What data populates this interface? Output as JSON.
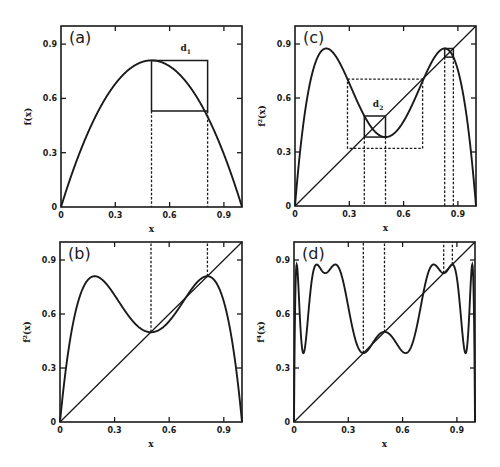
{
  "chart_data": [
    {
      "panel": "a",
      "type": "line",
      "panel_label": "(a)",
      "xlabel": "x",
      "ylabel": "f(x)",
      "xlim": [
        0,
        1
      ],
      "ylim": [
        0,
        1
      ],
      "x_ticks": [
        "0",
        "0.3",
        "0.6",
        "0.9"
      ],
      "y_ticks": [
        "0",
        "0.3",
        "0.6",
        "0.9"
      ],
      "series": [
        {
          "name": "f(x) = r x (1 - x)",
          "r": 3.24,
          "iterate": 1,
          "peak": 0.81
        }
      ],
      "annotations": [
        {
          "text": "d",
          "subscript": "1",
          "x": 0.66,
          "y": 0.86
        }
      ],
      "cobweb_solid": [
        [
          0.5,
          0.53
        ],
        [
          0.5,
          0.81
        ],
        [
          0.81,
          0.81
        ],
        [
          0.81,
          0.53
        ],
        [
          0.5,
          0.53
        ]
      ],
      "dashed_verticals": [
        {
          "x": 0.5,
          "y_top": 0.53
        },
        {
          "x": 0.81,
          "y_top": 0.53
        }
      ],
      "grid": false
    },
    {
      "panel": "b",
      "type": "line",
      "panel_label": "(b)",
      "xlabel": "x",
      "ylabel": "f²(x)",
      "xlim": [
        0,
        1
      ],
      "ylim": [
        0,
        1
      ],
      "x_ticks": [
        "0",
        "0.3",
        "0.6",
        "0.9"
      ],
      "y_ticks": [
        "0",
        "0.3",
        "0.6",
        "0.9"
      ],
      "series": [
        {
          "name": "f²(x)",
          "r": 3.24,
          "iterate": 2
        },
        {
          "name": "y = x",
          "diagonal": true
        }
      ],
      "dashed_verticals": [
        {
          "x": 0.5,
          "from_y": 0.5,
          "to_top": true
        },
        {
          "x": 0.81,
          "from_y": 0.81,
          "to_top": true
        }
      ],
      "grid": false
    },
    {
      "panel": "c",
      "type": "line",
      "panel_label": "(c)",
      "xlabel": "x",
      "ylabel": "f²(x)",
      "xlim": [
        0,
        1
      ],
      "ylim": [
        0,
        1
      ],
      "x_ticks": [
        "0",
        "0.3",
        "0.6",
        "0.9"
      ],
      "y_ticks": [
        "0",
        "0.3",
        "0.6",
        "0.9"
      ],
      "series": [
        {
          "name": "f²(x)",
          "r": 3.5,
          "iterate": 2
        },
        {
          "name": "y = x",
          "diagonal": true
        }
      ],
      "annotations": [
        {
          "text": "d",
          "subscript": "2",
          "x": 0.43,
          "y": 0.55
        }
      ],
      "solid_boxes": [
        {
          "x0": 0.383,
          "x1": 0.5,
          "y0": 0.383,
          "y1": 0.5,
          "with_cross": true
        },
        {
          "x0": 0.827,
          "x1": 0.875,
          "y0": 0.827,
          "y1": 0.875,
          "with_cross": true
        }
      ],
      "dashed_box": {
        "x0": 0.29,
        "x1": 0.705,
        "y0": 0.32,
        "y1": 0.705
      },
      "dashed_verticals": [
        {
          "x": 0.383
        },
        {
          "x": 0.5
        },
        {
          "x": 0.827
        },
        {
          "x": 0.875
        }
      ],
      "grid": false
    },
    {
      "panel": "d",
      "type": "line",
      "panel_label": "(d)",
      "xlabel": "x",
      "ylabel": "f⁴(x)",
      "xlim": [
        0,
        1
      ],
      "ylim": [
        0,
        1
      ],
      "x_ticks": [
        "0",
        "0.3",
        "0.6",
        "0.9"
      ],
      "y_ticks": [
        "0",
        "0.3",
        "0.6",
        "0.9"
      ],
      "series": [
        {
          "name": "f⁴(x)",
          "r": 3.5,
          "iterate": 4
        },
        {
          "name": "y = x",
          "diagonal": true
        }
      ],
      "dashed_verticals": [
        {
          "x": 0.383,
          "from_y": 0.383,
          "to_top": true
        },
        {
          "x": 0.5,
          "from_y": 0.5,
          "to_top": true
        },
        {
          "x": 0.827,
          "from_y": 0.827,
          "to_top": true
        },
        {
          "x": 0.875,
          "from_y": 0.875,
          "to_top": true
        }
      ],
      "grid": false
    }
  ],
  "panels": {
    "a": {
      "label": "(a)",
      "ylabel": "f(x)",
      "xlabel": "x",
      "annot": "d",
      "annot_sub": "1"
    },
    "b": {
      "label": "(b)",
      "ylabel": "f²(x)",
      "xlabel": "x"
    },
    "c": {
      "label": "(c)",
      "ylabel": "f²(x)",
      "xlabel": "x",
      "annot": "d",
      "annot_sub": "2"
    },
    "d": {
      "label": "(d)",
      "ylabel": "f⁴(x)",
      "xlabel": "x"
    }
  },
  "ticks": [
    "0",
    "0.3",
    "0.6",
    "0.9"
  ]
}
